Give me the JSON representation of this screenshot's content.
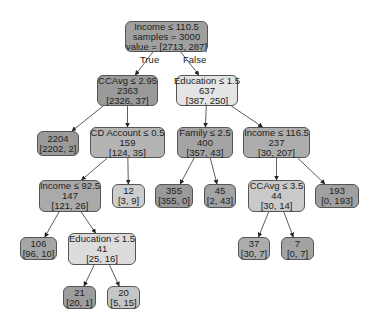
{
  "tree": {
    "nodes": [
      {
        "id": "root",
        "lines": [
          "Income ≤ 110.5",
          "samples = 3000",
          "value = [2713, 287]"
        ],
        "box": [
          125,
          21,
          83,
          31
        ],
        "color": "#a0a0a0"
      },
      {
        "id": "n1",
        "lines": [
          "CCAvg ≤ 2.95",
          "2363",
          "[2326, 37]"
        ],
        "box": [
          97,
          75,
          61,
          31
        ],
        "color": "#9a9a9a"
      },
      {
        "id": "n2",
        "lines": [
          "Education ≤ 1.5",
          "637",
          "[387, 250]"
        ],
        "box": [
          176,
          75,
          62,
          31
        ],
        "color": "#e4e4e4"
      },
      {
        "id": "n3",
        "lines": [
          "2204",
          "[2202, 2]"
        ],
        "box": [
          37,
          131,
          42,
          25
        ],
        "color": "#9a9a9a"
      },
      {
        "id": "n4",
        "lines": [
          "CD Account ≤ 0.5",
          "159",
          "[124, 35]"
        ],
        "box": [
          90,
          127,
          75,
          31
        ],
        "color": "#b4b4b4"
      },
      {
        "id": "n5",
        "lines": [
          "Family ≤ 2.5",
          "400",
          "[357, 43]"
        ],
        "box": [
          177,
          127,
          56,
          31
        ],
        "color": "#a4a4a4"
      },
      {
        "id": "n6",
        "lines": [
          "Income ≤ 116.5",
          "237",
          "[30, 207]"
        ],
        "box": [
          243,
          127,
          67,
          31
        ],
        "color": "#adadad"
      },
      {
        "id": "n7",
        "lines": [
          "Income ≤ 92.5",
          "147",
          "[121, 26]"
        ],
        "box": [
          39,
          180,
          62,
          32
        ],
        "color": "#aaaaaa"
      },
      {
        "id": "n8",
        "lines": [
          "12",
          "[3, 9]"
        ],
        "box": [
          112,
          184,
          33,
          24
        ],
        "color": "#cdcdcd"
      },
      {
        "id": "n9",
        "lines": [
          "355",
          "[355, 0]"
        ],
        "box": [
          155,
          184,
          38,
          24
        ],
        "color": "#999999"
      },
      {
        "id": "n10",
        "lines": [
          "45",
          "[2, 43]"
        ],
        "box": [
          204,
          184,
          32,
          24
        ],
        "color": "#a3a3a3"
      },
      {
        "id": "n11",
        "lines": [
          "CCAvg ≤ 3.5",
          "44",
          "[30, 14]"
        ],
        "box": [
          248,
          180,
          57,
          32
        ],
        "color": "#cacaca"
      },
      {
        "id": "n12",
        "lines": [
          "193",
          "[0, 193]"
        ],
        "box": [
          315,
          184,
          44,
          24
        ],
        "color": "#a0a0a0"
      },
      {
        "id": "n13",
        "lines": [
          "106",
          "[96, 10]"
        ],
        "box": [
          20,
          237,
          37,
          23
        ],
        "color": "#a6a6a6"
      },
      {
        "id": "n14",
        "lines": [
          "Education ≤ 1.5",
          "41",
          "[25, 16]"
        ],
        "box": [
          68,
          233,
          68,
          32
        ],
        "color": "#dcdcdc"
      },
      {
        "id": "n15",
        "lines": [
          "37",
          "[30, 7]"
        ],
        "box": [
          238,
          237,
          32,
          23
        ],
        "color": "#acacac"
      },
      {
        "id": "n16",
        "lines": [
          "7",
          "[0, 7]"
        ],
        "box": [
          281,
          237,
          33,
          23
        ],
        "color": "#a3a3a3"
      },
      {
        "id": "n17",
        "lines": [
          "21",
          "[20, 1]"
        ],
        "box": [
          63,
          286,
          33,
          23
        ],
        "color": "#9d9d9d"
      },
      {
        "id": "n18",
        "lines": [
          "20",
          "[5, 15]"
        ],
        "box": [
          107,
          286,
          33,
          23
        ],
        "color": "#c6c6c6"
      }
    ],
    "edges": [
      [
        "root",
        "n1"
      ],
      [
        "root",
        "n2"
      ],
      [
        "n1",
        "n3"
      ],
      [
        "n1",
        "n4"
      ],
      [
        "n2",
        "n5"
      ],
      [
        "n2",
        "n6"
      ],
      [
        "n4",
        "n7"
      ],
      [
        "n4",
        "n8"
      ],
      [
        "n5",
        "n9"
      ],
      [
        "n5",
        "n10"
      ],
      [
        "n6",
        "n11"
      ],
      [
        "n6",
        "n12"
      ],
      [
        "n7",
        "n13"
      ],
      [
        "n7",
        "n14"
      ],
      [
        "n11",
        "n15"
      ],
      [
        "n11",
        "n16"
      ],
      [
        "n14",
        "n17"
      ],
      [
        "n14",
        "n18"
      ]
    ],
    "edge_labels": [
      {
        "text": "True",
        "x": 140,
        "y": 54
      },
      {
        "text": "False",
        "x": 183,
        "y": 54
      }
    ]
  }
}
